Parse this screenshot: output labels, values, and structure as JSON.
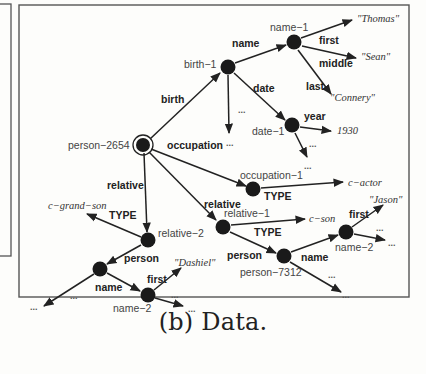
{
  "figure": {
    "caption": "(b) Data.",
    "colors": {
      "edge": "#222222",
      "node": "#1a1a1a",
      "frame": "#555555",
      "background": "#fdfdfb"
    }
  },
  "graph": {
    "nodes": [
      {
        "id": "person-2654",
        "label": "person-2654",
        "x": 143,
        "y": 145,
        "root": true
      },
      {
        "id": "birth-1",
        "label": "birth-1",
        "x": 228,
        "y": 67
      },
      {
        "id": "name-1",
        "label": "name-1",
        "x": 294,
        "y": 42
      },
      {
        "id": "date-1",
        "label": "date-1",
        "x": 292,
        "y": 125
      },
      {
        "id": "occupation-1",
        "label": "occupation-1",
        "x": 253,
        "y": 189
      },
      {
        "id": "relative-1",
        "label": "relative-1",
        "x": 223,
        "y": 227
      },
      {
        "id": "relative-2",
        "label": "relative-2",
        "x": 148,
        "y": 240
      },
      {
        "id": "person-7312",
        "label": "person-7312",
        "x": 284,
        "y": 256
      },
      {
        "id": "name-2-right",
        "label": "name-2",
        "x": 346,
        "y": 232
      },
      {
        "id": "person-left",
        "label": "",
        "x": 100,
        "y": 269
      },
      {
        "id": "name-2-left",
        "label": "name-2",
        "x": 148,
        "y": 295
      }
    ],
    "values": [
      {
        "id": "v-thomas",
        "label": "\"Thomas\"",
        "x": 345,
        "y": 22
      },
      {
        "id": "v-sean",
        "label": "\"Sean\"",
        "x": 360,
        "y": 60
      },
      {
        "id": "v-connery",
        "label": "\"Connery\"",
        "x": 330,
        "y": 100
      },
      {
        "id": "v-1930",
        "label": "1930",
        "x": 337,
        "y": 134
      },
      {
        "id": "v-cactor",
        "label": "c−actor",
        "x": 348,
        "y": 186
      },
      {
        "id": "v-cson",
        "label": "c−son",
        "x": 310,
        "y": 219
      },
      {
        "id": "v-jason",
        "label": "\"Jason\"",
        "x": 368,
        "y": 203
      },
      {
        "id": "v-cgrandson",
        "label": "c−grand−son",
        "x": 48,
        "y": 209
      },
      {
        "id": "v-dashiel",
        "label": "\"Dashiel\"",
        "x": 174,
        "y": 262
      }
    ],
    "edges": [
      {
        "from": "person-2654",
        "to": "birth-1",
        "label": "birth"
      },
      {
        "from": "birth-1",
        "to": "name-1",
        "label": "name"
      },
      {
        "from": "name-1",
        "to": "v-thomas",
        "label": "first"
      },
      {
        "from": "name-1",
        "to": "v-sean",
        "label": "middle"
      },
      {
        "from": "name-1",
        "to": "v-connery",
        "label": "last"
      },
      {
        "from": "birth-1",
        "to": "date-1",
        "label": "date"
      },
      {
        "from": "birth-1",
        "to": "more",
        "label": "..."
      },
      {
        "from": "date-1",
        "to": "v-1930",
        "label": "year"
      },
      {
        "from": "date-1",
        "to": "more",
        "label": "..."
      },
      {
        "from": "person-2654",
        "to": "occupation-1",
        "label": "occupation"
      },
      {
        "from": "occupation-1",
        "to": "v-cactor",
        "label": "TYPE"
      },
      {
        "from": "person-2654",
        "to": "relative-1",
        "label": "relative"
      },
      {
        "from": "relative-1",
        "to": "v-cson",
        "label": "TYPE"
      },
      {
        "from": "relative-1",
        "to": "person-7312",
        "label": "person"
      },
      {
        "from": "person-7312",
        "to": "name-2-right",
        "label": "name"
      },
      {
        "from": "person-7312",
        "to": "more",
        "label": "..."
      },
      {
        "from": "name-2-right",
        "to": "v-jason",
        "label": "first"
      },
      {
        "from": "name-2-right",
        "to": "more",
        "label": "..."
      },
      {
        "from": "person-2654",
        "to": "relative-2",
        "label": "relative"
      },
      {
        "from": "relative-2",
        "to": "v-cgrandson",
        "label": "TYPE"
      },
      {
        "from": "relative-2",
        "to": "person-left",
        "label": "person"
      },
      {
        "from": "person-left",
        "to": "name-2-left",
        "label": "name"
      },
      {
        "from": "person-left",
        "to": "more",
        "label": "..."
      },
      {
        "from": "name-2-left",
        "to": "v-dashiel",
        "label": "first"
      },
      {
        "from": "name-2-left",
        "to": "more",
        "label": "..."
      }
    ]
  },
  "labels": {
    "nodes": {
      "person_2654": "person−2654",
      "birth_1": "birth−1",
      "name_1": "name−1",
      "date_1": "date−1",
      "occupation_1": "occupation−1",
      "relative_1": "relative−1",
      "relative_2": "relative−2",
      "person_7312": "person−7312",
      "name_2_right": "name−2",
      "name_2_left": "name−2"
    },
    "edges": {
      "birth": "birth",
      "name_top": "name",
      "first_top": "first",
      "middle": "middle",
      "last": "last",
      "date": "date",
      "year": "year",
      "occupation": "occupation",
      "type_occ": "TYPE",
      "relative_right": "relative",
      "type_rel1": "TYPE",
      "person_right": "person",
      "name_right": "name",
      "first_right": "first",
      "relative_left": "relative",
      "type_rel2": "TYPE",
      "person_left": "person",
      "name_left": "name",
      "first_left": "first",
      "ellipsis": "..."
    },
    "values": {
      "thomas": "\"Thomas\"",
      "sean": "\"Sean\"",
      "connery": "\"Connery\"",
      "year_1930": "1930",
      "c_actor": "c−actor",
      "c_son": "c−son",
      "jason": "\"Jason\"",
      "c_grand_son": "c−grand−son",
      "dashiel": "\"Dashiel\"",
      "ellipsis": "..."
    }
  }
}
